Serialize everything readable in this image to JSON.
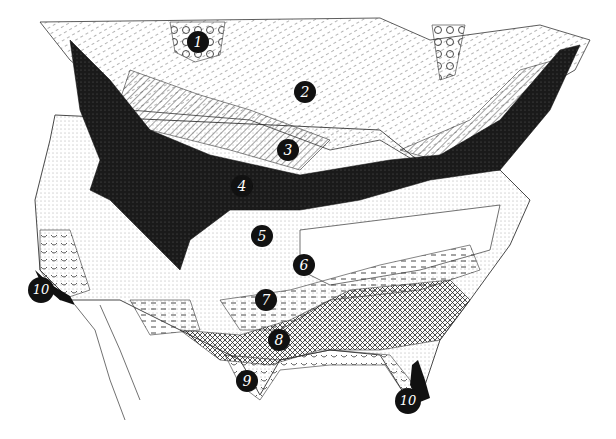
{
  "map": {
    "description": "Illustrated vegetation/region map of North America (United States and southern Canada) with numbered regions",
    "colors": {
      "ink": "#111111",
      "paper": "#ffffff",
      "border": "#333333"
    },
    "regions": [
      {
        "id": 1,
        "label": "1",
        "x": 198,
        "y": 42,
        "pattern": "circles"
      },
      {
        "id": 2,
        "label": "2",
        "x": 305,
        "y": 92,
        "pattern": "dashed-diagonal"
      },
      {
        "id": 3,
        "label": "3",
        "x": 288,
        "y": 150,
        "pattern": "diagonal-hatch"
      },
      {
        "id": 4,
        "label": "4",
        "x": 242,
        "y": 186,
        "pattern": "solid-dark-stipple"
      },
      {
        "id": 5,
        "label": "5",
        "x": 262,
        "y": 236,
        "pattern": "stipple"
      },
      {
        "id": 6,
        "label": "6",
        "x": 304,
        "y": 265,
        "pattern": "blank"
      },
      {
        "id": 7,
        "label": "7",
        "x": 266,
        "y": 300,
        "pattern": "horizontal-dashes"
      },
      {
        "id": 8,
        "label": "8",
        "x": 279,
        "y": 340,
        "pattern": "cross-hatch"
      },
      {
        "id": 9,
        "label": "9",
        "x": 247,
        "y": 381,
        "pattern": "scallops"
      },
      {
        "id": 10,
        "label": "10",
        "x": 41,
        "y": 290,
        "pattern": "solid-black"
      },
      {
        "id": 10,
        "label": "10",
        "x": 408,
        "y": 401,
        "pattern": "solid-black"
      }
    ]
  }
}
